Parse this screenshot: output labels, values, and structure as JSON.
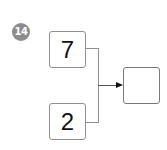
{
  "problem": {
    "number": "14"
  },
  "diagram": {
    "inputs": [
      {
        "value": "7"
      },
      {
        "value": "2"
      }
    ],
    "output": {
      "value": ""
    },
    "colors": {
      "badge": "#8c8c8c",
      "border": "#8f8f8f",
      "arrow": "#111111"
    }
  }
}
